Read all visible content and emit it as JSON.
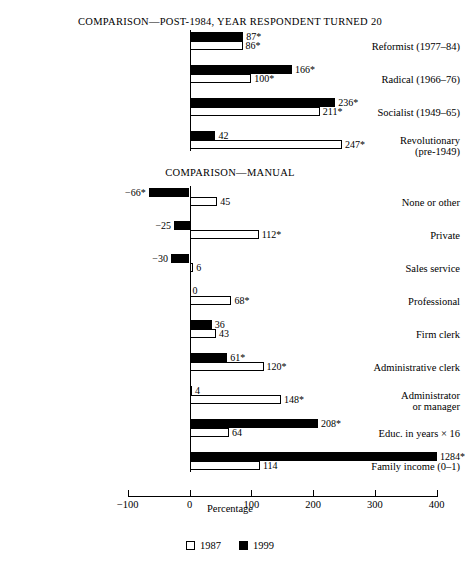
{
  "chart_data": {
    "type": "bar",
    "orientation": "horizontal",
    "title": "",
    "xlabel": "Percentage",
    "ylabel": "",
    "xlim": [
      -100,
      400
    ],
    "xticks": [
      -100,
      0,
      100,
      200,
      300,
      400
    ],
    "xtick_labels": [
      "−100",
      "0",
      "100",
      "200",
      "300",
      "400"
    ],
    "grid": false,
    "legend_position": "bottom-center",
    "legend": [
      {
        "name": "1987",
        "style": "open-square",
        "color": "#ffffff"
      },
      {
        "name": "1999",
        "style": "filled-square",
        "color": "#000000"
      }
    ],
    "series_names": [
      "1987",
      "1999"
    ],
    "note": "Values marked with an asterisk (*) are statistically significant. Bars exceeding the 400 axis limit are clipped at the plot edge.",
    "panels": [
      {
        "panel_title": "COMPARISON—POST-1984, YEAR RESPONDENT TURNED 20",
        "categories": [
          "Reformist (1977–84)",
          "Radical (1966–76)",
          "Socialist (1949–65)",
          "Revolutionary\n(pre-1949)"
        ],
        "series": [
          {
            "name": "1999",
            "values": [
              87,
              166,
              236,
              42
            ],
            "labels": [
              "87*",
              "166*",
              "236*",
              "42"
            ]
          },
          {
            "name": "1987",
            "values": [
              86,
              100,
              211,
              247
            ],
            "labels": [
              "86*",
              "100*",
              "211*",
              "247*"
            ]
          }
        ]
      },
      {
        "panel_title": "COMPARISON—MANUAL",
        "categories": [
          "None or other",
          "Private",
          "Sales service",
          "Professional",
          "Firm clerk",
          "Administrative clerk",
          "Administrator\nor manager",
          "Educ. in years × 16",
          "Family income (0–1)"
        ],
        "series": [
          {
            "name": "1999",
            "values": [
              -66,
              -25,
              -30,
              0,
              36,
              61,
              4,
              208,
              1284
            ],
            "labels": [
              "−66*",
              "−25",
              "−30",
              "0",
              "36",
              "61*",
              "4",
              "208*",
              "1284*"
            ]
          },
          {
            "name": "1987",
            "values": [
              45,
              112,
              6,
              68,
              43,
              120,
              148,
              64,
              114
            ],
            "labels": [
              "45",
              "112*",
              "6",
              "68*",
              "43",
              "120*",
              "148*",
              "64",
              "114"
            ]
          }
        ]
      }
    ]
  },
  "axis": {
    "title": "Percentage",
    "ticks": [
      "−100",
      "0",
      "100",
      "200",
      "300",
      "400"
    ]
  },
  "legend": {
    "item1": "1987",
    "item2": "1999"
  },
  "titles": {
    "top": "COMPARISON—POST-1984, YEAR RESPONDENT TURNED 20",
    "bottom": "COMPARISON—MANUAL"
  }
}
